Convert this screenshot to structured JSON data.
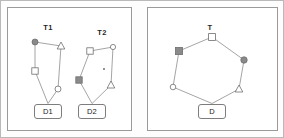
{
  "figure": {
    "title": "",
    "background": "#fdfdfd",
    "outer_border_color": "#b9b9b9",
    "panel_border_color": "#9a9a9a",
    "edge_color": "#8d8d8d",
    "node_stroke": "#6f6f6f",
    "node_fill_open": "#ffffff",
    "node_fill_solid": "#8a8a8a"
  },
  "panels": [
    {
      "id": "panel-left",
      "name": "separate-trees-panel",
      "x": 6,
      "y": 6,
      "w": 125,
      "h": 124
    },
    {
      "id": "panel-right",
      "name": "merged-tree-panel",
      "x": 146,
      "y": 6,
      "w": 131,
      "h": 124
    }
  ],
  "trees": [
    {
      "id": "T1",
      "label": "T1",
      "label_x": 47,
      "label_y": 22,
      "doc": {
        "label": "D1",
        "x": 47,
        "y": 110,
        "w": 28,
        "h": 15
      },
      "nodes": [
        {
          "id": "t1-n1",
          "shape": "circle-filled",
          "x": 34,
          "y": 41,
          "r": 3.0
        },
        {
          "id": "t1-n2",
          "shape": "triangle-open",
          "x": 60,
          "y": 45,
          "r": 4.0
        },
        {
          "id": "t1-n3",
          "shape": "square-open",
          "x": 34,
          "y": 70,
          "r": 3.2
        },
        {
          "id": "t1-n4",
          "shape": "circle-open",
          "x": 57,
          "y": 88,
          "r": 3.0
        }
      ],
      "edges": [
        [
          "t1-n1",
          "t1-n2"
        ],
        [
          "t1-n1",
          "t1-n3"
        ],
        [
          "t1-n2",
          "t1-n4"
        ],
        [
          "t1-n3",
          "doc"
        ],
        [
          "t1-n4",
          "doc"
        ]
      ]
    },
    {
      "id": "T2",
      "label": "T2",
      "label_x": 101,
      "label_y": 27,
      "doc": {
        "label": "D2",
        "x": 91,
        "y": 110,
        "w": 28,
        "h": 15
      },
      "nodes": [
        {
          "id": "t2-n1",
          "shape": "square-open",
          "x": 89,
          "y": 50,
          "r": 3.2
        },
        {
          "id": "t2-n2",
          "shape": "circle-open",
          "x": 112,
          "y": 46,
          "r": 2.6
        },
        {
          "id": "t2-n3",
          "shape": "square-filled",
          "x": 78,
          "y": 79,
          "r": 3.2
        },
        {
          "id": "t2-n4",
          "shape": "triangle-open",
          "x": 110,
          "y": 84,
          "r": 4.0
        },
        {
          "id": "t2-dot",
          "shape": "dot",
          "x": 103,
          "y": 68,
          "r": 1.0
        }
      ],
      "edges": [
        [
          "t2-n1",
          "t2-n2"
        ],
        [
          "t2-n1",
          "t2-n3"
        ],
        [
          "t2-n2",
          "t2-n4"
        ],
        [
          "t2-n3",
          "doc"
        ],
        [
          "t2-n4",
          "doc"
        ]
      ]
    },
    {
      "id": "T",
      "label": "T",
      "label_x": 209,
      "label_y": 22,
      "doc": {
        "label": "D",
        "x": 211,
        "y": 110,
        "w": 28,
        "h": 15
      },
      "nodes": [
        {
          "id": "t-n1",
          "shape": "square-open",
          "x": 211,
          "y": 36,
          "r": 3.4
        },
        {
          "id": "t-n2",
          "shape": "square-filled",
          "x": 178,
          "y": 50,
          "r": 3.6
        },
        {
          "id": "t-n3",
          "shape": "circle-filled",
          "x": 243,
          "y": 59,
          "r": 3.2
        },
        {
          "id": "t-n4",
          "shape": "circle-open",
          "x": 172,
          "y": 86,
          "r": 2.8
        },
        {
          "id": "t-n5",
          "shape": "triangle-open",
          "x": 238,
          "y": 88,
          "r": 4.0
        }
      ],
      "edges": [
        [
          "t-n2",
          "t-n1"
        ],
        [
          "t-n1",
          "t-n3"
        ],
        [
          "t-n2",
          "t-n4"
        ],
        [
          "t-n3",
          "t-n5"
        ],
        [
          "t-n4",
          "doc"
        ],
        [
          "t-n5",
          "doc"
        ]
      ]
    }
  ]
}
